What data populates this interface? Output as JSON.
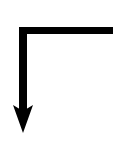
{
  "diagram": {
    "type": "bent-arrow",
    "stroke_color": "#000000",
    "background_color": "#ffffff",
    "direction": "down",
    "corner": "top-left"
  }
}
